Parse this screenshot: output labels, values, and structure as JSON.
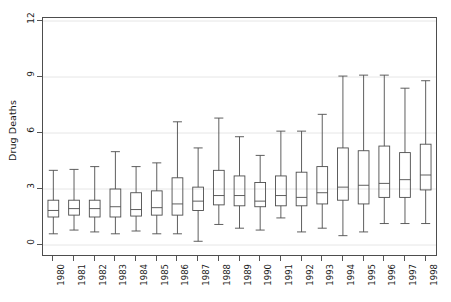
{
  "chart_data": {
    "type": "box",
    "title": "",
    "xlabel": "",
    "ylabel": "Drug Deaths",
    "ylim": [
      -0.75,
      12.3
    ],
    "yticks": [
      0,
      3,
      6,
      9,
      12
    ],
    "ytick_labels": [
      "0",
      "3",
      "6",
      "9",
      "12"
    ],
    "grid": "horizontal",
    "grid_color": "#e6e6e6",
    "box_line_color": "#4d4d4d",
    "frame_color": "#4d4d4d",
    "legend": "none",
    "categories": [
      "1980",
      "1981",
      "1982",
      "1983",
      "1984",
      "1985",
      "1986",
      "1987",
      "1988",
      "1989",
      "1990",
      "1991",
      "1992",
      "1993",
      "1994",
      "1995",
      "1996",
      "1997",
      "1998"
    ],
    "boxes": [
      {
        "category": "1980",
        "whisker_low": 0.6,
        "q1": 1.5,
        "median": 1.85,
        "q3": 2.4,
        "whisker_high": 4.0
      },
      {
        "category": "1981",
        "whisker_low": 0.8,
        "q1": 1.6,
        "median": 1.95,
        "q3": 2.4,
        "whisker_high": 4.05
      },
      {
        "category": "1982",
        "whisker_low": 0.7,
        "q1": 1.5,
        "median": 1.95,
        "q3": 2.4,
        "whisker_high": 4.2
      },
      {
        "category": "1983",
        "whisker_low": 0.6,
        "q1": 1.5,
        "median": 2.05,
        "q3": 3.0,
        "whisker_high": 5.0
      },
      {
        "category": "1984",
        "whisker_low": 0.75,
        "q1": 1.55,
        "median": 1.9,
        "q3": 2.8,
        "whisker_high": 4.2
      },
      {
        "category": "1985",
        "whisker_low": 0.6,
        "q1": 1.6,
        "median": 2.0,
        "q3": 2.9,
        "whisker_high": 4.4
      },
      {
        "category": "1986",
        "whisker_low": 0.6,
        "q1": 1.6,
        "median": 2.2,
        "q3": 3.6,
        "whisker_high": 6.6
      },
      {
        "category": "1987",
        "whisker_low": 0.2,
        "q1": 1.85,
        "median": 2.35,
        "q3": 3.1,
        "whisker_high": 5.2
      },
      {
        "category": "1988",
        "whisker_low": 1.1,
        "q1": 2.15,
        "median": 2.65,
        "q3": 4.0,
        "whisker_high": 6.8
      },
      {
        "category": "1989",
        "whisker_low": 0.9,
        "q1": 2.1,
        "median": 2.65,
        "q3": 3.7,
        "whisker_high": 5.8
      },
      {
        "category": "1990",
        "whisker_low": 0.8,
        "q1": 2.05,
        "median": 2.35,
        "q3": 3.35,
        "whisker_high": 4.8
      },
      {
        "category": "1991",
        "whisker_low": 1.45,
        "q1": 2.1,
        "median": 2.65,
        "q3": 3.7,
        "whisker_high": 6.1
      },
      {
        "category": "1992",
        "whisker_low": 0.7,
        "q1": 2.1,
        "median": 2.55,
        "q3": 3.9,
        "whisker_high": 6.1
      },
      {
        "category": "1993",
        "whisker_low": 0.9,
        "q1": 2.2,
        "median": 2.8,
        "q3": 4.2,
        "whisker_high": 7.0
      },
      {
        "category": "1994",
        "whisker_low": 0.5,
        "q1": 2.4,
        "median": 3.1,
        "q3": 5.2,
        "whisker_high": 9.05
      },
      {
        "category": "1995",
        "whisker_low": 0.7,
        "q1": 2.2,
        "median": 3.2,
        "q3": 5.05,
        "whisker_high": 9.1
      },
      {
        "category": "1996",
        "whisker_low": 1.15,
        "q1": 2.55,
        "median": 3.3,
        "q3": 5.3,
        "whisker_high": 9.1
      },
      {
        "category": "1997",
        "whisker_low": 1.15,
        "q1": 2.55,
        "median": 3.5,
        "q3": 4.95,
        "whisker_high": 8.4
      },
      {
        "category": "1998",
        "whisker_low": 1.15,
        "q1": 2.95,
        "median": 3.75,
        "q3": 5.4,
        "whisker_high": 8.8
      }
    ]
  }
}
